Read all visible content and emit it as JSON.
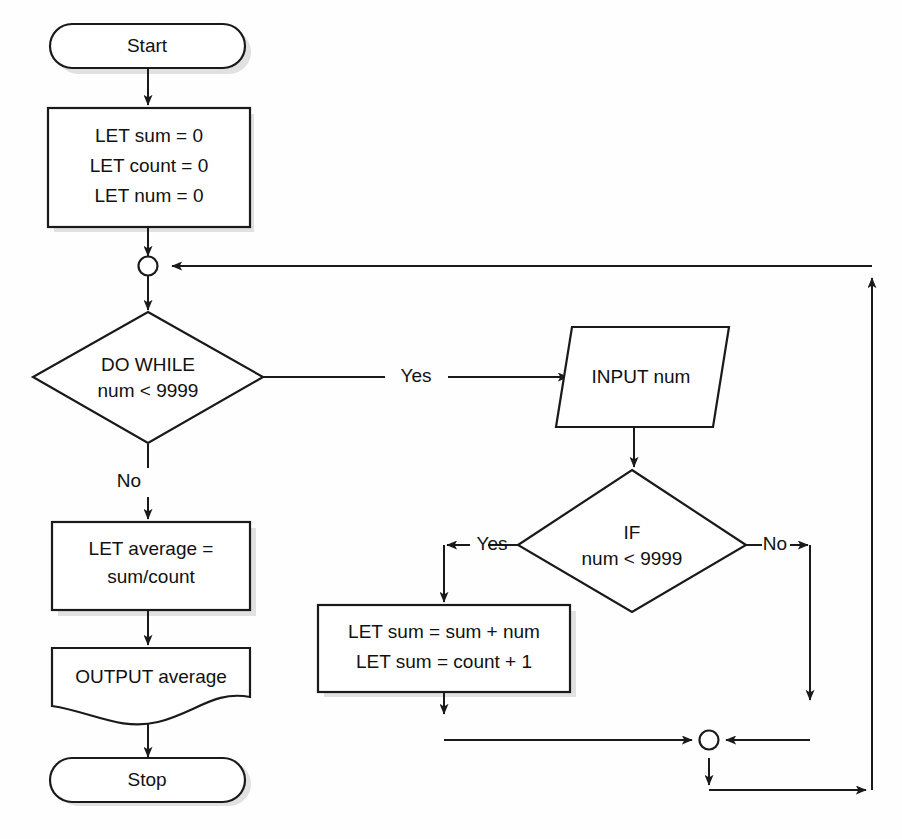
{
  "diagram": {
    "type": "flowchart",
    "canvas": {
      "width": 902,
      "height": 839
    },
    "stroke_color": "#1a1a1a",
    "fill_color": "#ffffff",
    "text_color": "#111111"
  },
  "nodes": {
    "start": {
      "label": "Start",
      "shape": "terminator"
    },
    "init": {
      "shape": "process",
      "line1": "LET sum = 0",
      "line2": "LET count = 0",
      "line3": "LET num = 0"
    },
    "loop_junction": {
      "shape": "connector-circle",
      "label": ""
    },
    "do_while": {
      "shape": "decision",
      "line1": "DO WHILE",
      "line2": "num < 9999"
    },
    "input_num": {
      "shape": "parallelogram",
      "label": "INPUT num"
    },
    "if_check": {
      "shape": "decision",
      "line1": "IF",
      "line2": "num < 9999"
    },
    "accumulate": {
      "shape": "process",
      "line1": "LET sum = sum + num",
      "line2": "LET sum = count + 1"
    },
    "merge_junction": {
      "shape": "connector-circle",
      "label": ""
    },
    "average": {
      "shape": "process",
      "line1": "LET average =",
      "line2": "sum/count"
    },
    "output": {
      "shape": "document",
      "label": "OUTPUT average"
    },
    "stop": {
      "label": "Stop",
      "shape": "terminator"
    }
  },
  "edge_labels": {
    "do_while_yes": "Yes",
    "do_while_no": "No",
    "if_yes": "Yes",
    "if_no": "No"
  }
}
